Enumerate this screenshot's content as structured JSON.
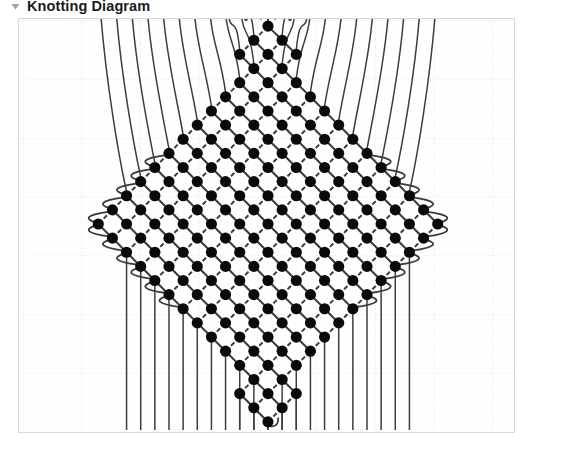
{
  "header": {
    "title": "Knotting Diagram",
    "collapse_icon": "triangle-down-icon"
  },
  "canvas": {
    "name": "knotting-diagram-canvas",
    "width": 497,
    "height": 415,
    "background_color": "#fefefe",
    "border_color": "#d8d8dc"
  },
  "grid": {
    "visible": true,
    "style": "dotted",
    "color": "#e4e4ea",
    "cell_size": 59,
    "origin_x": 4,
    "origin_y": 2
  },
  "diagram": {
    "type": "macrame-knotting-lattice",
    "shape": "diamond",
    "knot_color": "#0a0a0a",
    "cord_color": "#3c3c3c",
    "knot_radius": 5.6,
    "lattice_half_spacing": 14.2,
    "center_x": 268,
    "center_y": 224,
    "half_width": 172,
    "half_height": 204,
    "rows": 29,
    "knot_count": 421,
    "top_cords": 13,
    "bottom_cords": 22,
    "connector_solid_direction": "NE-SW",
    "connector_dashed_direction": "NW-SE",
    "edge_loops": true
  }
}
